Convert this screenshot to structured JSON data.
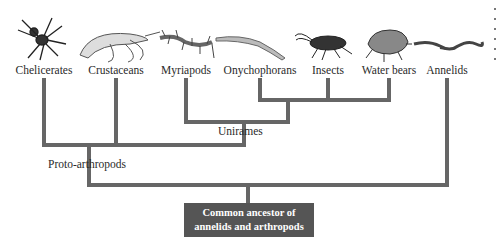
{
  "diagram": {
    "type": "phylogenetic-tree",
    "taxa": [
      {
        "label": "Chelicerates",
        "icon": "spider-icon",
        "x": 44
      },
      {
        "label": "Crustaceans",
        "icon": "shrimp-icon",
        "x": 116
      },
      {
        "label": "Myriapods",
        "icon": "centipede-icon",
        "x": 186
      },
      {
        "label": "Onychophorans",
        "icon": "velvet-worm-icon",
        "x": 260
      },
      {
        "label": "Insects",
        "icon": "cockroach-icon",
        "x": 328
      },
      {
        "label": "Water bears",
        "icon": "tardigrade-icon",
        "x": 389
      },
      {
        "label": "Annelids",
        "icon": "worm-icon",
        "x": 447
      }
    ],
    "clades": {
      "uniramian": "Unirames",
      "proto": "Proto-arthropods"
    },
    "root": {
      "line1": "Common ancestor of",
      "line2": "annelids and arthropods"
    },
    "colors": {
      "branch": "#666666",
      "root_box": "#555555",
      "root_text": "#ffffff",
      "label_text": "#2a2a2a"
    }
  }
}
